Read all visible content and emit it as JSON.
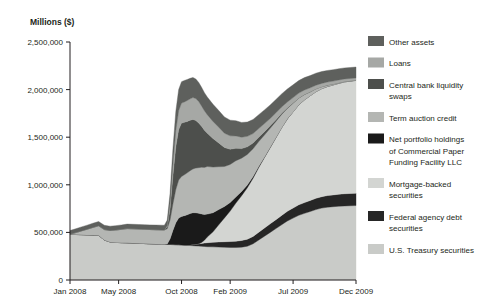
{
  "chart_data": {
    "type": "area",
    "stacked": true,
    "title": "",
    "ylabel": "Millions ($)",
    "xlabel": "",
    "ylim": [
      0,
      2500000
    ],
    "yticks": [
      0,
      500000,
      1000000,
      1500000,
      2000000,
      2500000
    ],
    "ytick_labels": [
      "0",
      "500,000",
      "1,000,000",
      "1,500,000",
      "2,000,000",
      "2,500,000"
    ],
    "grid": false,
    "legend_position": "right",
    "xtick_labels": [
      "Jan 2008",
      "May 2008",
      "Oct 2008",
      "Feb 2009",
      "Jul 2009",
      "Dec 2009"
    ],
    "xtick_positions": [
      0,
      17,
      39,
      56,
      78,
      100
    ],
    "x": [
      0,
      2,
      4,
      6,
      8,
      10,
      12,
      14,
      16,
      18,
      20,
      22,
      24,
      26,
      28,
      30,
      32,
      33,
      34,
      35,
      36,
      37,
      38,
      39,
      40,
      41,
      42,
      43,
      44,
      45,
      46,
      47,
      48,
      50,
      52,
      54,
      56,
      58,
      60,
      62,
      64,
      66,
      68,
      70,
      72,
      74,
      76,
      78,
      80,
      82,
      84,
      86,
      88,
      90,
      92,
      94,
      96,
      98,
      100
    ],
    "series": [
      {
        "name": "U.S. Treasury securities",
        "color": "#c9cbc8",
        "values": [
          480000,
          478000,
          476000,
          474000,
          472000,
          470000,
          420000,
          400000,
          395000,
          392000,
          390000,
          388000,
          385000,
          383000,
          380000,
          378000,
          376000,
          375000,
          374000,
          373000,
          372000,
          371000,
          370000,
          368000,
          366000,
          364000,
          362000,
          360000,
          358000,
          356000,
          354000,
          352000,
          350000,
          348000,
          346000,
          344000,
          342000,
          342000,
          345000,
          355000,
          380000,
          420000,
          460000,
          500000,
          540000,
          580000,
          620000,
          650000,
          680000,
          700000,
          720000,
          740000,
          755000,
          765000,
          770000,
          775000,
          778000,
          780000,
          782000
        ]
      },
      {
        "name": "Federal agency debt securities",
        "color": "#262626",
        "values": [
          0,
          0,
          0,
          0,
          0,
          0,
          0,
          0,
          0,
          0,
          0,
          0,
          0,
          0,
          0,
          0,
          0,
          0,
          0,
          0,
          0,
          0,
          0,
          0,
          0,
          2000,
          6000,
          12000,
          18000,
          24000,
          30000,
          36000,
          42000,
          48000,
          54000,
          58000,
          62000,
          66000,
          70000,
          74000,
          78000,
          82000,
          86000,
          90000,
          94000,
          98000,
          102000,
          106000,
          110000,
          113000,
          116000,
          118000,
          120000,
          122000,
          124000,
          126000,
          128000,
          129000,
          130000
        ]
      },
      {
        "name": "Mortgage-backed securities",
        "color": "#d3d5d2",
        "values": [
          0,
          0,
          0,
          0,
          0,
          0,
          0,
          0,
          0,
          0,
          0,
          0,
          0,
          0,
          0,
          0,
          0,
          0,
          0,
          0,
          0,
          0,
          0,
          0,
          0,
          0,
          0,
          0,
          0,
          0,
          10000,
          30000,
          60000,
          110000,
          180000,
          250000,
          320000,
          400000,
          470000,
          540000,
          610000,
          680000,
          740000,
          800000,
          860000,
          920000,
          970000,
          1010000,
          1050000,
          1080000,
          1100000,
          1120000,
          1135000,
          1145000,
          1155000,
          1165000,
          1175000,
          1180000,
          1185000
        ]
      },
      {
        "name": "Net portfolio holdings of Commercial Paper Funding Facility LLC",
        "color": "#1a1a1a",
        "values": [
          0,
          0,
          0,
          0,
          0,
          0,
          0,
          0,
          0,
          0,
          0,
          0,
          0,
          0,
          0,
          0,
          0,
          0,
          5000,
          60000,
          150000,
          230000,
          280000,
          300000,
          310000,
          320000,
          330000,
          335000,
          330000,
          320000,
          300000,
          270000,
          240000,
          200000,
          160000,
          120000,
          90000,
          65000,
          45000,
          30000,
          20000,
          12000,
          7000,
          4000,
          2000,
          1000,
          500,
          0,
          0,
          0,
          0,
          0,
          0,
          0,
          0,
          0,
          0,
          0,
          0
        ]
      },
      {
        "name": "Term auction credit",
        "color": "#b4b6b3",
        "values": [
          0,
          20000,
          40000,
          60000,
          80000,
          100000,
          110000,
          120000,
          130000,
          140000,
          150000,
          150000,
          150000,
          150000,
          150000,
          150000,
          150000,
          150000,
          160000,
          200000,
          280000,
          350000,
          400000,
          420000,
          430000,
          440000,
          450000,
          460000,
          470000,
          480000,
          490000,
          495000,
          500000,
          480000,
          450000,
          420000,
          400000,
          380000,
          350000,
          320000,
          290000,
          260000,
          230000,
          200000,
          170000,
          140000,
          110000,
          90000,
          70000,
          55000,
          40000,
          30000,
          20000,
          15000,
          10000,
          7000,
          5000,
          3000,
          2000
        ]
      },
      {
        "name": "Central bank liquidity swaps",
        "color": "#4d4f4c",
        "values": [
          0,
          0,
          0,
          0,
          0,
          0,
          0,
          0,
          0,
          0,
          0,
          0,
          0,
          0,
          0,
          0,
          0,
          0,
          20000,
          120000,
          300000,
          450000,
          530000,
          560000,
          550000,
          540000,
          530000,
          520000,
          500000,
          470000,
          430000,
          390000,
          350000,
          300000,
          250000,
          200000,
          160000,
          130000,
          100000,
          80000,
          60000,
          45000,
          35000,
          25000,
          18000,
          12000,
          8000,
          5000,
          3000,
          2000,
          1000,
          500,
          200,
          100,
          50,
          20,
          10,
          5,
          0
        ]
      },
      {
        "name": "Loans",
        "color": "#a6a8a5",
        "values": [
          0,
          0,
          0,
          0,
          0,
          0,
          0,
          0,
          0,
          0,
          0,
          0,
          0,
          0,
          0,
          0,
          0,
          0,
          10000,
          60000,
          120000,
          170000,
          200000,
          210000,
          215000,
          220000,
          225000,
          230000,
          230000,
          225000,
          215000,
          205000,
          195000,
          180000,
          165000,
          150000,
          140000,
          130000,
          120000,
          110000,
          100000,
          92000,
          85000,
          78000,
          72000,
          66000,
          60000,
          55000,
          50000,
          46000,
          42000,
          38000,
          35000,
          32000,
          30000,
          28000,
          26000,
          25000,
          24000
        ]
      },
      {
        "name": "Other assets",
        "color": "#5e605d",
        "values": [
          40000,
          40000,
          42000,
          42000,
          44000,
          44000,
          45000,
          45000,
          46000,
          46000,
          47000,
          47000,
          48000,
          48000,
          49000,
          49000,
          50000,
          50000,
          60000,
          100000,
          160000,
          200000,
          220000,
          225000,
          225000,
          220000,
          215000,
          210000,
          205000,
          200000,
          195000,
          190000,
          185000,
          180000,
          175000,
          170000,
          165000,
          160000,
          155000,
          150000,
          148000,
          146000,
          144000,
          142000,
          140000,
          138000,
          136000,
          134000,
          132000,
          130000,
          128000,
          126000,
          124000,
          122000,
          120000,
          118000,
          116000,
          115000,
          114000
        ]
      }
    ]
  },
  "legend": {
    "items": [
      {
        "label": "Other assets",
        "color": "#5e605d"
      },
      {
        "label": "Loans",
        "color": "#a6a8a5"
      },
      {
        "label": "Central bank liquidity swaps",
        "color": "#4d4f4c"
      },
      {
        "label": "Term auction credit",
        "color": "#b4b6b3"
      },
      {
        "label": "Net portfolio holdings of Commercial Paper Funding Facility LLC",
        "color": "#1a1a1a"
      },
      {
        "label": "Mortgage-backed securities",
        "color": "#d3d5d2"
      },
      {
        "label": "Federal agency debt securities",
        "color": "#262626"
      },
      {
        "label": "U.S. Treasury securities",
        "color": "#c9cbc8"
      }
    ]
  }
}
